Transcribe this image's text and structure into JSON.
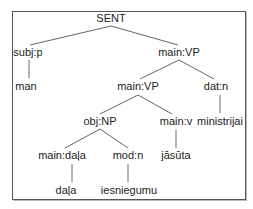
{
  "diagram": {
    "type": "parse-tree",
    "nodes": [
      {
        "id": "n0",
        "label": "SENT",
        "x": 111,
        "y": 22
      },
      {
        "id": "n1",
        "label": "subj:p",
        "x": 28,
        "y": 56
      },
      {
        "id": "n2",
        "label": "man",
        "x": 26,
        "y": 90
      },
      {
        "id": "n3",
        "label": "main:VP",
        "x": 179,
        "y": 56
      },
      {
        "id": "n4",
        "label": "main:VP",
        "x": 138,
        "y": 90
      },
      {
        "id": "n5",
        "label": "dat:n",
        "x": 216,
        "y": 90
      },
      {
        "id": "n6",
        "label": "obj:NP",
        "x": 100,
        "y": 125
      },
      {
        "id": "n7",
        "label": "main:v",
        "x": 176,
        "y": 125
      },
      {
        "id": "n8",
        "label": "ministrijai",
        "x": 220,
        "y": 125
      },
      {
        "id": "n9",
        "label": "main:daļa",
        "x": 62,
        "y": 159
      },
      {
        "id": "n10",
        "label": "mod:n",
        "x": 128,
        "y": 159
      },
      {
        "id": "n11",
        "label": "jāsūta",
        "x": 176,
        "y": 159
      },
      {
        "id": "n12",
        "label": "daļa",
        "x": 66,
        "y": 194
      },
      {
        "id": "n13",
        "label": "iesniegumu",
        "x": 129,
        "y": 194
      }
    ],
    "edges": [
      {
        "from": [
          111,
          26
        ],
        "to": [
          30,
          45
        ]
      },
      {
        "from": [
          111,
          26
        ],
        "to": [
          178,
          45
        ]
      },
      {
        "from": [
          29,
          60
        ],
        "to": [
          29,
          78
        ]
      },
      {
        "from": [
          179,
          60
        ],
        "to": [
          140,
          79
        ]
      },
      {
        "from": [
          179,
          60
        ],
        "to": [
          214,
          79
        ]
      },
      {
        "from": [
          138,
          95
        ],
        "to": [
          100,
          114
        ]
      },
      {
        "from": [
          138,
          95
        ],
        "to": [
          172,
          114
        ]
      },
      {
        "from": [
          220,
          95
        ],
        "to": [
          220,
          113
        ]
      },
      {
        "from": [
          100,
          129
        ],
        "to": [
          65,
          148
        ]
      },
      {
        "from": [
          100,
          129
        ],
        "to": [
          128,
          148
        ]
      },
      {
        "from": [
          176,
          130
        ],
        "to": [
          176,
          148
        ]
      },
      {
        "from": [
          72,
          164
        ],
        "to": [
          72,
          182
        ]
      },
      {
        "from": [
          128,
          164
        ],
        "to": [
          128,
          182
        ]
      }
    ]
  }
}
